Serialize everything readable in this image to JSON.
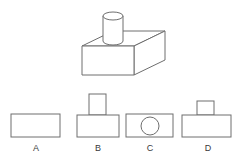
{
  "page": {
    "kind": "orthographic-projection-question",
    "background_color": "#ffffff",
    "stroke_color": "#6e6e6e",
    "fill_color": "#ffffff",
    "label_color": "#3a3a3a"
  },
  "prompt_figure": {
    "name": "isometric-solid",
    "description": "cylinder resting on a rectangular box",
    "parts": [
      {
        "name": "box",
        "shape": "rectangular-prism"
      },
      {
        "name": "cylinder",
        "shape": "cylinder"
      }
    ],
    "geometry": {
      "box_top_face": "82,46 113,31 165,31 134,46",
      "box_front_face": "82,46 134,46 134,75 82,75",
      "box_right_face": "134,46 165,31 165,60 134,75",
      "cylinder_left_x": 103,
      "cylinder_right_x": 123,
      "cylinder_top_y": 16,
      "cylinder_bottom_y": 41,
      "cylinder_ellipse_ry": 4
    }
  },
  "options": [
    {
      "id": "A",
      "label": "A",
      "description": "plain rectangle",
      "base": {
        "x": 11,
        "y": 114,
        "w": 49,
        "h": 23
      },
      "stem": null,
      "circle": null
    },
    {
      "id": "B",
      "label": "B",
      "description": "rectangle with tall narrow rectangle on top",
      "base": {
        "x": 77,
        "y": 115,
        "w": 42,
        "h": 22
      },
      "stem": {
        "x": 89,
        "y": 94,
        "w": 17,
        "h": 21
      },
      "circle": null
    },
    {
      "id": "C",
      "label": "C",
      "description": "rectangle with circle inside",
      "base": {
        "x": 126,
        "y": 114,
        "w": 47,
        "h": 23
      },
      "stem": null,
      "circle": {
        "cx": 150,
        "cy": 126,
        "r": 9
      }
    },
    {
      "id": "D",
      "label": "D",
      "description": "rectangle with short narrow rectangle on top",
      "base": {
        "x": 182,
        "y": 115,
        "w": 49,
        "h": 22
      },
      "stem": {
        "x": 197,
        "y": 101,
        "w": 17,
        "h": 14
      },
      "circle": null
    }
  ]
}
